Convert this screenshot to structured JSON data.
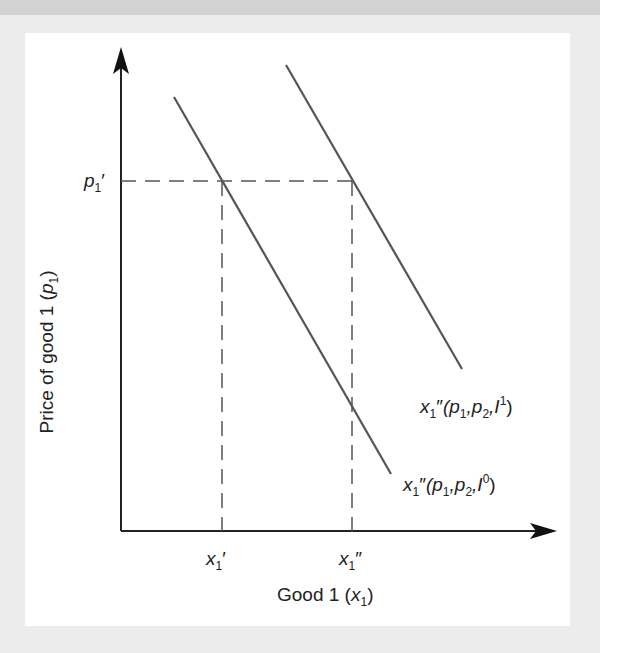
{
  "diagram": {
    "type": "demand-curve-shift",
    "y_axis_label": {
      "text": "Price of good 1 (",
      "var": "p",
      "sub": "1",
      "close": ")"
    },
    "x_axis_label": {
      "text": "Good 1 (",
      "var": "x",
      "sub": "1",
      "close": ")"
    },
    "price_tick": {
      "var": "p",
      "sub": "1",
      "prime": "′"
    },
    "x_ticks": [
      {
        "var": "x",
        "sub": "1",
        "prime": "′"
      },
      {
        "var": "x",
        "sub": "1",
        "prime": "″"
      }
    ],
    "curves": [
      {
        "name": "demand-income-0",
        "label_pre": "x",
        "label_sub": "1",
        "label_prime": "″",
        "label_args": "(p",
        "arg1_sub": "1",
        "arg2": ",p",
        "arg2_sub": "2",
        "arg3": ",I",
        "sup": "0",
        "close": ")",
        "color": "#555555"
      },
      {
        "name": "demand-income-1",
        "label_pre": "x",
        "label_sub": "1",
        "label_prime": "″",
        "label_args": "(p",
        "arg1_sub": "1",
        "arg2": ",p",
        "arg2_sub": "2",
        "arg3": ",I",
        "sup": "1",
        "close": ")",
        "color": "#555555"
      }
    ]
  }
}
